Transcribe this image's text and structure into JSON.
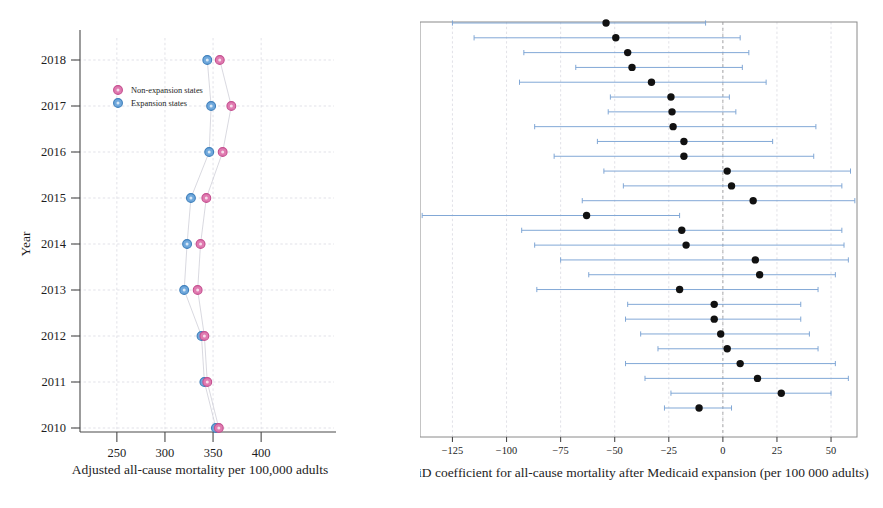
{
  "left_panel": {
    "y_axis_title": "Year",
    "x_axis_title": "Adjusted all-cause mortality per 100,000 adults",
    "y_ticks": [
      "2018",
      "2017",
      "2016",
      "2015",
      "2014",
      "2013",
      "2012",
      "2011",
      "2010"
    ],
    "x_ticks": [
      "250",
      "300",
      "350",
      "400"
    ],
    "legend": [
      {
        "label": "Non-expansion states",
        "color": "#e07ab0",
        "marker": "circle"
      },
      {
        "label": "Expansion states",
        "color": "#6fa8dc",
        "marker": "circle"
      }
    ]
  },
  "right_panel": {
    "x_axis_title": "DiD coefficient for all-cause mortality after Medicaid expansion (per 100 000 adults)",
    "x_ticks": [
      "−125",
      "−100",
      "−75",
      "−50",
      "−25",
      "0",
      "25",
      "50"
    ]
  },
  "chart_data": [
    {
      "type": "scatter",
      "id": "adjusted-mortality-by-year",
      "title": "",
      "xlabel": "Adjusted all-cause mortality per 100,000 adults",
      "ylabel": "Year",
      "xlim": [
        220,
        430
      ],
      "ylim": [
        2009.5,
        2018.6
      ],
      "grid": true,
      "legend": [
        "Non-expansion states",
        "Expansion states"
      ],
      "legend_position": "upper-left-inside",
      "categories": [
        2010,
        2011,
        2012,
        2013,
        2014,
        2015,
        2016,
        2017,
        2018
      ],
      "series": [
        {
          "name": "Expansion states",
          "color": "#6fa8dc",
          "values": [
            353,
            341,
            338,
            320,
            323,
            327,
            346,
            348,
            344
          ]
        },
        {
          "name": "Non-expansion states",
          "color": "#e07ab0",
          "values": [
            356,
            344,
            341,
            334,
            337,
            343,
            360,
            369,
            357
          ]
        }
      ]
    },
    {
      "type": "scatter",
      "id": "did-coefficient-forest",
      "title": "",
      "xlabel": "DiD coefficient for all-cause mortality after Medicaid expansion (per 100 000 adults)",
      "ylabel": "",
      "xlim": [
        -140,
        62
      ],
      "xticks": [
        -125,
        -100,
        -75,
        -50,
        -25,
        0,
        25,
        50
      ],
      "grid": true,
      "zero_reference_line": 0,
      "point_color": "#111111",
      "interval_color": "#7ba3d4",
      "categories": [
        "Rhode Island",
        "Connecticut",
        "New Jersey",
        "New York",
        "Pennsylvania*",
        "New Hampshire",
        "Vermont",
        "Minnesota",
        "Iowa",
        "Illinois",
        "Indiana",
        "Ohio",
        "Nebraska",
        "Delaware",
        "Louisiana",
        "Maryland",
        "Kentucky",
        "District of Columbia",
        "Nevada",
        "Washington",
        "Hawaii",
        "Colorado",
        "Montana",
        "Arizona",
        "Oregon",
        "New Mexico",
        "Overall"
      ],
      "values": [
        -54.0,
        -49.5,
        -44.0,
        -42.0,
        -33.0,
        -24.0,
        -23.5,
        -23.0,
        -18.0,
        -18.0,
        2.0,
        4.0,
        14.0,
        -63.0,
        -19.0,
        -17.0,
        15.0,
        17.0,
        -20.0,
        -4.0,
        -4.0,
        -1.0,
        2.0,
        8.0,
        16.0,
        27.0,
        -11.0
      ],
      "ci_low": [
        -125.0,
        -115.0,
        -92.0,
        -68.0,
        -94.0,
        -52.0,
        -53.0,
        -87.0,
        -58.0,
        -78.0,
        -55.0,
        -46.0,
        -65.0,
        -139.0,
        -93.0,
        -87.0,
        -75.0,
        -62.0,
        -86.0,
        -44.0,
        -45.0,
        -38.0,
        -30.0,
        -45.0,
        -36.0,
        -24.0,
        -27.0
      ],
      "ci_high": [
        -8.0,
        8.0,
        12.0,
        9.0,
        20.0,
        3.0,
        6.0,
        43.0,
        23.0,
        42.0,
        59.0,
        55.0,
        93.0,
        -20.0,
        55.0,
        56.0,
        58.0,
        52.0,
        44.0,
        36.0,
        36.0,
        40.0,
        44.0,
        52.0,
        58.0,
        50.0,
        4.0
      ]
    }
  ]
}
